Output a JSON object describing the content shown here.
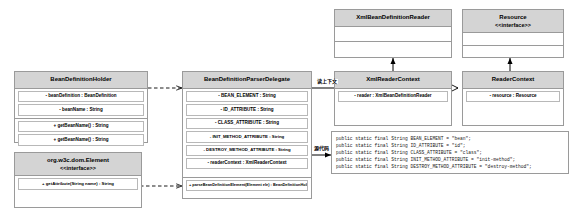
{
  "diagram": {
    "boxes": {
      "bean_definition_holder": {
        "name": "BeanDefinitionHolder",
        "stereotype": "",
        "attributes": [
          "- beanDefinition : BeanDefinition",
          "- beanName : String"
        ],
        "methods": [
          "+ getBeanName() : String",
          "+ getBeanName() : String"
        ]
      },
      "w3c_element": {
        "name": "org.w3c.dom.Element",
        "stereotype": "<<interface>>",
        "attributes": [],
        "methods": [
          "+ getAttribute(String name) : String"
        ]
      },
      "parser_delegate": {
        "name": "BeanDefinitionParserDelegate",
        "stereotype": "",
        "attributes": [
          "- BEAN_ELEMENT : String",
          "- ID_ATTRIBUTE : String",
          "- CLASS_ATTRIBUTE : String",
          "- INIT_METHOD_ATTRIBUTE : String",
          "- DESTROY_METHOD_ATTRIBUTE : String",
          "- readerContext : XmlReaderContext"
        ],
        "methods": [
          "+ parseBeanDefinitionElement(Element ele) : BeanDefinitionHolder"
        ]
      },
      "xml_bean_definition_reader": {
        "name": "XmlBeanDefinitionReader",
        "stereotype": "",
        "attributes": [],
        "methods": []
      },
      "resource": {
        "name": "Resource",
        "stereotype": "<<interface>>",
        "attributes": [],
        "methods": []
      },
      "xml_reader_context": {
        "name": "XmlReaderContext",
        "stereotype": "",
        "attributes": [
          "- reader : XmlBeanDefinitionReader"
        ],
        "methods": []
      },
      "reader_context": {
        "name": "ReaderContext",
        "stereotype": "",
        "attributes": [
          "- resource : Resource"
        ],
        "methods": []
      }
    },
    "edge_labels": {
      "context_label": "读上下文",
      "source_label": "源代码"
    },
    "code_snippet": "public static final String BEAN_ELEMENT = \"bean\";\npublic static final String ID_ATTRIBUTE = \"id\";\npublic static final String CLASS_ATTRIBUTE = \"class\";\npublic static final String INIT_METHOD_ATTRIBUTE = \"init-method\";\npublic static final String DESTROY_METHOD_ATTRIBUTE = \"destroy-method\";",
    "colors": {
      "header_fill": "#d4d4d4",
      "border": "#9a9a9a",
      "line": "#000000",
      "background": "#ffffff"
    }
  }
}
